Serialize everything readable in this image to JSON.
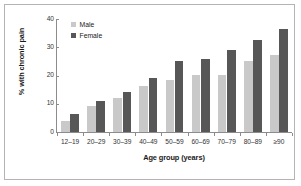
{
  "chart_data": {
    "type": "bar",
    "title": "",
    "subtitle": "",
    "xlabel": "Age group (years)",
    "ylabel": "% with chronic pain",
    "categories": [
      "12–19",
      "20–29",
      "30–39",
      "40–49",
      "50–59",
      "60–69",
      "70–79",
      "80–89",
      "≥90"
    ],
    "series": [
      {
        "name": "Male",
        "color": "#c9c9c9",
        "values": [
          4.0,
          9.3,
          12.0,
          16.3,
          18.5,
          20.3,
          20.3,
          25.0,
          27.3
        ]
      },
      {
        "name": "Female",
        "color": "#575757",
        "values": [
          6.5,
          11.0,
          14.3,
          19.0,
          25.3,
          26.0,
          29.2,
          32.4,
          36.5
        ]
      }
    ],
    "ylim": [
      0,
      40
    ],
    "yticks": [
      0,
      10,
      20,
      30,
      40
    ],
    "ytick_labels": [
      "0",
      "10",
      "20",
      "30",
      "40"
    ],
    "grid": false,
    "legend_position": "top-left"
  },
  "legend": {
    "items": [
      {
        "label": "Male",
        "color": "#c9c9c9"
      },
      {
        "label": "Female",
        "color": "#575757"
      }
    ]
  },
  "frame": {
    "border_color": "#b4b4b4",
    "background": "#ffffff"
  },
  "axes": {
    "axis_color": "#8c8c8c",
    "text_color": "#333333"
  }
}
